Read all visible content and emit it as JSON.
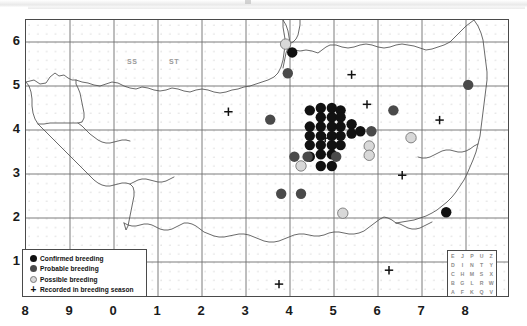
{
  "figure": {
    "type": "species-distribution-atlas-map",
    "region": "South-west England (Ordnance Survey 100 km squares SS / ST / SX / SY)"
  },
  "axes": {
    "x_tick_labels": [
      "8",
      "9",
      "0",
      "1",
      "2",
      "3",
      "4",
      "5",
      "6",
      "7",
      "8"
    ],
    "y_tick_labels": [
      "6",
      "5",
      "4",
      "3",
      "2",
      "1"
    ],
    "x_label": "",
    "y_label": ""
  },
  "grid_square_labels": [
    {
      "text": "SS",
      "x": 2.1,
      "y": 5.45
    },
    {
      "text": "ST",
      "x": 3.0,
      "y": 5.45
    }
  ],
  "legend": {
    "items": [
      {
        "symbol": "filled-black-circle",
        "label": "Confirmed breeding",
        "color": "#111111"
      },
      {
        "symbol": "filled-grey-circle",
        "label": "Probable breeding",
        "color": "#4a4a4a"
      },
      {
        "symbol": "open-light-circle",
        "label": "Possible breeding",
        "color": "#d8d8d8"
      },
      {
        "symbol": "plus-cross",
        "label": "Recorded in breeding season",
        "color": "#111111"
      }
    ]
  },
  "grid_letter_key": {
    "rows": [
      [
        "E",
        "J",
        "P",
        "U",
        "Z"
      ],
      [
        "D",
        "I",
        "N",
        "T",
        "Y"
      ],
      [
        "C",
        "H",
        "M",
        "S",
        "X"
      ],
      [
        "B",
        "G",
        "L",
        "R",
        "W"
      ],
      [
        "A",
        "F",
        "K",
        "Q",
        "V"
      ]
    ]
  },
  "chart_data": {
    "type": "scatter",
    "title": "",
    "xlabel": "",
    "ylabel": "",
    "xlim": [
      7.5,
      18.5
    ],
    "ylim": [
      0.5,
      6.5
    ],
    "grid": true,
    "legend_position": "bottom-left",
    "note": "x tick labels repeat OS 100km-square digits 8,9,0..8; internal x axis is continuous 7.5-18.5",
    "series": [
      {
        "name": "Confirmed breeding",
        "color": "#111111",
        "points": [
          [
            13.55,
            5.8
          ],
          [
            14.65,
            4.55
          ],
          [
            14.2,
            4.4
          ],
          [
            14.45,
            4.4
          ],
          [
            14.65,
            4.4
          ],
          [
            13.95,
            4.2
          ],
          [
            14.2,
            4.2
          ],
          [
            14.45,
            4.2
          ],
          [
            14.65,
            4.2
          ],
          [
            14.9,
            4.25
          ],
          [
            13.95,
            4.0
          ],
          [
            14.2,
            4.0
          ],
          [
            14.45,
            4.0
          ],
          [
            14.65,
            4.0
          ],
          [
            14.9,
            4.05
          ],
          [
            13.95,
            3.8
          ],
          [
            14.2,
            3.8
          ],
          [
            14.45,
            3.8
          ],
          [
            14.65,
            3.8
          ],
          [
            15.1,
            4.1
          ],
          [
            14.45,
            4.6
          ],
          [
            14.2,
            4.6
          ],
          [
            13.95,
            4.55
          ],
          [
            14.45,
            3.6
          ],
          [
            14.2,
            3.6
          ],
          [
            13.95,
            3.55
          ],
          [
            14.45,
            3.35
          ],
          [
            14.2,
            3.35
          ],
          [
            17.05,
            2.35
          ]
        ]
      },
      {
        "name": "Probable breeding",
        "color": "#4a4a4a",
        "points": [
          [
            13.45,
            5.35
          ],
          [
            13.05,
            4.35
          ],
          [
            15.35,
            4.1
          ],
          [
            15.85,
            4.55
          ],
          [
            17.55,
            5.1
          ],
          [
            13.3,
            2.75
          ],
          [
            13.75,
            2.75
          ],
          [
            13.6,
            3.55
          ],
          [
            13.9,
            3.55
          ],
          [
            14.55,
            3.55
          ]
        ]
      },
      {
        "name": "Possible breeding",
        "color": "#d8d8d8",
        "points": [
          [
            13.4,
            5.98
          ],
          [
            15.3,
            3.78
          ],
          [
            15.3,
            3.58
          ],
          [
            16.25,
            3.96
          ],
          [
            14.7,
            2.33
          ],
          [
            13.75,
            3.35
          ]
        ]
      },
      {
        "name": "Recorded in breeding season",
        "color": "#111111",
        "points": [
          [
            12.1,
            4.52
          ],
          [
            14.9,
            5.32
          ],
          [
            15.25,
            4.68
          ],
          [
            14.3,
            3.95
          ],
          [
            14.45,
            3.95
          ],
          [
            16.9,
            4.34
          ],
          [
            16.05,
            3.15
          ],
          [
            15.75,
            1.1
          ],
          [
            13.25,
            0.8
          ]
        ]
      }
    ]
  }
}
